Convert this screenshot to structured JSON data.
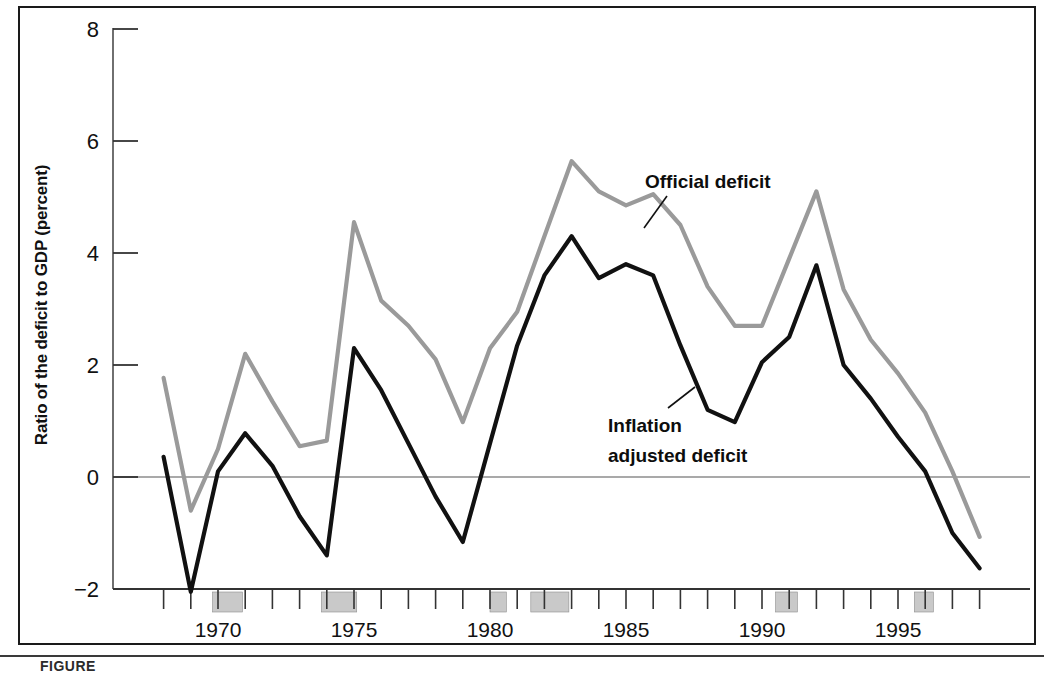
{
  "figure": {
    "caption_partial": "FIGURE",
    "y_axis_title": "Ratio of the deficit to GDP (percent)",
    "annotations": {
      "official": "Official deficit",
      "inflation_line1": "Inflation",
      "inflation_line2": "adjusted deficit"
    },
    "colors": {
      "official_deficit": "#9a9a9a",
      "inflation_adjusted_deficit": "#111111",
      "zero_line": "#555555",
      "axis": "#333333",
      "recession_band": "#c9c9c9",
      "frame": "#1a1a1a"
    }
  },
  "chart_data": {
    "type": "line",
    "title": "",
    "xlabel": "",
    "ylabel": "Ratio of the deficit to GDP (percent)",
    "ylim": [
      -2,
      8
    ],
    "xlim": [
      1968,
      1998
    ],
    "yticks": [
      -2,
      0,
      2,
      4,
      6,
      8
    ],
    "ytick_labels": [
      "−2",
      "0",
      "2",
      "4",
      "6",
      "8"
    ],
    "xticks": [
      1968,
      1969,
      1970,
      1971,
      1972,
      1973,
      1974,
      1975,
      1976,
      1977,
      1978,
      1979,
      1980,
      1981,
      1982,
      1983,
      1984,
      1985,
      1986,
      1987,
      1988,
      1989,
      1990,
      1991,
      1992,
      1993,
      1994,
      1995,
      1996,
      1997,
      1998
    ],
    "xtick_labels": [
      "1970",
      "1975",
      "1980",
      "1985",
      "1990",
      "1995"
    ],
    "xtick_label_years": [
      1970,
      1975,
      1980,
      1985,
      1990,
      1995
    ],
    "grid": false,
    "legend_position": "inline-annotation",
    "zero_reference_line": 0,
    "recession_bands": [
      {
        "start": 1969.8,
        "end": 1970.9
      },
      {
        "start": 1973.8,
        "end": 1975.1
      },
      {
        "start": 1980.0,
        "end": 1980.6
      },
      {
        "start": 1981.5,
        "end": 1982.9
      },
      {
        "start": 1990.5,
        "end": 1991.3
      },
      {
        "start": 1995.6,
        "end": 1996.3
      }
    ],
    "x": [
      1968,
      1969,
      1970,
      1971,
      1972,
      1973,
      1974,
      1975,
      1976,
      1977,
      1978,
      1979,
      1980,
      1981,
      1982,
      1983,
      1984,
      1985,
      1986,
      1987,
      1988,
      1989,
      1990,
      1991,
      1992,
      1993,
      1994,
      1995,
      1996,
      1997,
      1998
    ],
    "series": [
      {
        "name": "Official deficit",
        "color": "#9a9a9a",
        "values": [
          1.77,
          -0.6,
          0.5,
          2.2,
          1.35,
          0.55,
          0.65,
          4.55,
          3.15,
          2.7,
          2.1,
          0.98,
          2.3,
          2.95,
          4.3,
          5.64,
          5.1,
          4.85,
          5.05,
          4.5,
          3.4,
          2.7,
          2.7,
          3.9,
          5.1,
          3.35,
          2.45,
          1.85,
          1.15,
          0.1,
          -1.07
        ]
      },
      {
        "name": "Inflation adjusted deficit",
        "color": "#111111",
        "values": [
          0.36,
          -2.05,
          0.1,
          0.78,
          0.2,
          -0.7,
          -1.4,
          2.3,
          1.55,
          0.6,
          -0.35,
          -1.16,
          0.6,
          2.35,
          3.6,
          4.3,
          3.55,
          3.8,
          3.6,
          2.35,
          1.2,
          0.98,
          2.05,
          2.5,
          3.78,
          2.0,
          1.4,
          0.72,
          0.1,
          -1.0,
          -1.63
        ]
      }
    ]
  }
}
